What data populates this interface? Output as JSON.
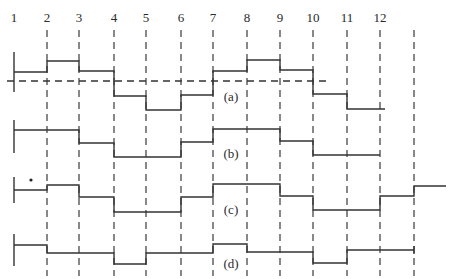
{
  "diagram": {
    "type": "staircase-waveforms",
    "column_numbers": [
      "1",
      "2",
      "3",
      "4",
      "5",
      "6",
      "7",
      "8",
      "9",
      "10",
      "11",
      "12"
    ],
    "column_x": [
      14,
      47,
      79,
      114,
      146,
      181,
      213,
      247,
      280,
      313,
      347,
      380,
      414
    ],
    "dashed_line_x": [
      47,
      79,
      114,
      146,
      181,
      213,
      247,
      280,
      313,
      347,
      380,
      414
    ],
    "colors": {
      "line": "#333333",
      "background": "#ffffff"
    },
    "rows": [
      {
        "label": "(a)",
        "label_pos": [
          231,
          101
        ],
        "start_tick": [
          52,
          92
        ],
        "baseline": {
          "y": 81,
          "x1": 7,
          "x2": 330
        },
        "steps": [
          [
            14,
            47,
            72
          ],
          [
            47,
            79,
            61
          ],
          [
            79,
            114,
            71
          ],
          [
            114,
            146,
            96
          ],
          [
            146,
            181,
            110
          ],
          [
            181,
            213,
            95
          ],
          [
            213,
            247,
            71
          ],
          [
            247,
            280,
            60
          ],
          [
            280,
            313,
            70
          ],
          [
            313,
            347,
            94
          ],
          [
            347,
            385,
            109
          ]
        ]
      },
      {
        "label": "(b)",
        "label_pos": [
          231,
          158
        ],
        "start_tick": [
          120,
          153
        ],
        "steps": [
          [
            14,
            79,
            130
          ],
          [
            79,
            114,
            143
          ],
          [
            114,
            181,
            157
          ],
          [
            181,
            213,
            142
          ],
          [
            213,
            280,
            129
          ],
          [
            280,
            313,
            141
          ],
          [
            313,
            380,
            155
          ]
        ]
      },
      {
        "label": "(c)",
        "label_pos": [
          231,
          214
        ],
        "start_tick": [
          177,
          203
        ],
        "marker_dot": [
          31,
          180
        ],
        "steps": [
          [
            14,
            47,
            190
          ],
          [
            47,
            79,
            185
          ],
          [
            79,
            114,
            197
          ],
          [
            114,
            181,
            212
          ],
          [
            181,
            213,
            197
          ],
          [
            213,
            280,
            184
          ],
          [
            280,
            313,
            196
          ],
          [
            313,
            380,
            210
          ],
          [
            380,
            414,
            196
          ],
          [
            414,
            446,
            186
          ]
        ]
      },
      {
        "label": "(d)",
        "label_pos": [
          231,
          268
        ],
        "start_tick": [
          234,
          266
        ],
        "steps": [
          [
            14,
            47,
            245
          ],
          [
            47,
            114,
            253
          ],
          [
            114,
            146,
            264
          ],
          [
            146,
            213,
            253
          ],
          [
            213,
            247,
            244
          ],
          [
            247,
            313,
            252
          ],
          [
            313,
            347,
            263
          ],
          [
            347,
            414,
            250
          ]
        ]
      }
    ]
  }
}
